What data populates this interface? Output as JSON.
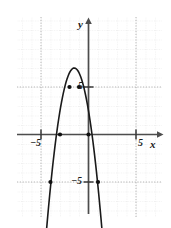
{
  "figure": {
    "kind": "cartesian-graph",
    "background": "#ffffff",
    "grid_color": "#b9b9b9",
    "axis_color": "#4d4d4d",
    "curve_color": "#1a1a1a",
    "point_color": "#111111"
  },
  "axis_labels": {
    "x_axis_name": "x",
    "y_axis_name": "y",
    "x_neg_tick": "−5",
    "x_pos_tick": "5",
    "y_pos_tick": "5",
    "y_neg_tick": "−5"
  },
  "chart_data": {
    "type": "line",
    "title": "",
    "xlabel": "x",
    "ylabel": "y",
    "xlim": [
      -7.3,
      8.2
    ],
    "ylim": [
      -8.5,
      8.2
    ],
    "grid": true,
    "grid_step": 1,
    "gridline_major_step": 5,
    "legend": "none",
    "xticks": [
      -5,
      5
    ],
    "yticks": [
      -5,
      5
    ],
    "xtick_labels": [
      "−5",
      "5"
    ],
    "ytick_labels": [
      "−5",
      "5"
    ],
    "series": [
      {
        "name": "parabola",
        "type": "quadratic",
        "equation": "y = -2(x + 1.5)^2 + 7",
        "a": -2,
        "h": -1.5,
        "k": 7,
        "vertex": [
          -1.5,
          7
        ],
        "opens": "down",
        "x": [
          -4.4,
          -4.0,
          -3.5,
          -3.0,
          -2.5,
          -2.0,
          -1.5,
          -1.0,
          -0.5,
          0.0,
          0.5,
          1.0,
          1.5,
          2.0,
          2.3
        ],
        "y": [
          -9.8,
          -5.5,
          -1.0,
          2.5,
          5.0,
          6.5,
          7.0,
          6.5,
          5.0,
          2.5,
          -1.0,
          -5.5,
          -11.0,
          -17.5,
          -21.9
        ]
      }
    ],
    "marked_points": [
      {
        "x": -4,
        "y": -5
      },
      {
        "x": -3,
        "y": 0
      },
      {
        "x": -2,
        "y": 5
      },
      {
        "x": -1,
        "y": 5
      },
      {
        "x": 0,
        "y": 0
      },
      {
        "x": 1,
        "y": -5
      }
    ]
  }
}
